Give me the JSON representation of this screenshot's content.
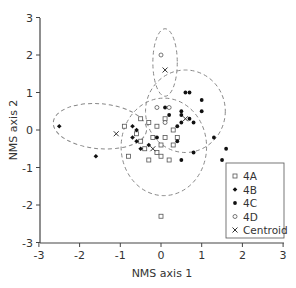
{
  "chart_data": {
    "type": "scatter",
    "title": "",
    "xlabel": "NMS axis 1",
    "ylabel": "NMS axis 2",
    "xlim": [
      -3,
      3
    ],
    "ylim": [
      -3,
      3
    ],
    "xticks": [
      -3,
      -2,
      -1,
      0,
      1,
      2,
      3
    ],
    "yticks": [
      -3,
      -2,
      -1,
      0,
      1,
      2,
      3
    ],
    "grid": false,
    "legend_position": "lower right",
    "legend": [
      {
        "label": "4A",
        "marker": "open-square"
      },
      {
        "label": "4B",
        "marker": "filled-diamond"
      },
      {
        "label": "4C",
        "marker": "filled-circle"
      },
      {
        "label": "4D",
        "marker": "open-circle"
      },
      {
        "label": "Centroid",
        "marker": "x"
      }
    ],
    "series": [
      {
        "name": "4A",
        "marker": "open-square",
        "points": [
          [
            -0.8,
            -0.7
          ],
          [
            -0.5,
            0.3
          ],
          [
            -0.3,
            0.2
          ],
          [
            -0.2,
            -0.2
          ],
          [
            -0.1,
            0.1
          ],
          [
            0.0,
            -0.4
          ],
          [
            -0.4,
            -0.5
          ],
          [
            -0.6,
            -0.1
          ],
          [
            -0.3,
            -0.8
          ],
          [
            0.1,
            -0.2
          ],
          [
            -0.1,
            -0.6
          ],
          [
            0.2,
            -0.8
          ],
          [
            0.3,
            -0.4
          ],
          [
            0.0,
            -0.7
          ],
          [
            0.4,
            -0.2
          ],
          [
            -0.5,
            -0.3
          ],
          [
            0.0,
            -2.3
          ],
          [
            0.1,
            0.3
          ],
          [
            0.3,
            0.0
          ],
          [
            -0.9,
            0.1
          ]
        ],
        "centroid": [
          -0.2,
          -0.5
        ]
      },
      {
        "name": "4B",
        "marker": "filled-diamond",
        "points": [
          [
            -2.5,
            0.1
          ],
          [
            -1.6,
            -0.7
          ],
          [
            -0.7,
            0.1
          ],
          [
            -0.6,
            0.0
          ],
          [
            -0.7,
            -0.2
          ],
          [
            -0.6,
            -0.3
          ],
          [
            -0.5,
            -0.5
          ],
          [
            -0.3,
            -0.4
          ]
        ],
        "centroid": [
          -1.1,
          -0.1
        ]
      },
      {
        "name": "4C",
        "marker": "filled-circle",
        "points": [
          [
            0.4,
            0.1
          ],
          [
            0.6,
            1.0
          ],
          [
            0.7,
            1.0
          ],
          [
            1.0,
            0.8
          ],
          [
            0.2,
            0.4
          ],
          [
            0.5,
            0.5
          ],
          [
            0.5,
            0.4
          ],
          [
            0.7,
            0.3
          ],
          [
            0.5,
            0.2
          ],
          [
            0.8,
            0.2
          ],
          [
            1.3,
            -0.2
          ],
          [
            1.6,
            -0.5
          ],
          [
            0.8,
            -0.6
          ],
          [
            1.5,
            -0.8
          ],
          [
            0.5,
            -0.8
          ],
          [
            -0.1,
            -0.2
          ],
          [
            0.1,
            0.6
          ],
          [
            0.4,
            -0.3
          ],
          [
            1.0,
            0.5
          ]
        ],
        "centroid": [
          0.6,
          0.3
        ]
      },
      {
        "name": "4D",
        "marker": "open-circle",
        "points": [
          [
            0.0,
            2.0
          ],
          [
            -0.1,
            0.6
          ],
          [
            0.2,
            0.6
          ],
          [
            0.1,
            0.2
          ]
        ],
        "centroid": [
          0.1,
          1.6
        ]
      }
    ],
    "ellipses": [
      {
        "group": "4D",
        "cx": 0.1,
        "cy": 1.8,
        "rx": 0.3,
        "ry": 0.9,
        "rotation": 0
      },
      {
        "group": "4A",
        "cx": 0.07,
        "cy": -0.45,
        "rx": 1.05,
        "ry": 1.3,
        "rotation": 0
      },
      {
        "group": "4C",
        "cx": 0.6,
        "cy": 0.5,
        "rx": 0.98,
        "ry": 1.1,
        "rotation": 0
      },
      {
        "group": "4B",
        "cx": -1.5,
        "cy": 0.1,
        "rx": 1.15,
        "ry": 0.6,
        "rotation": 5
      }
    ]
  },
  "axes": {
    "x_title": "NMS axis 1",
    "y_title": "NMS axis 2"
  }
}
